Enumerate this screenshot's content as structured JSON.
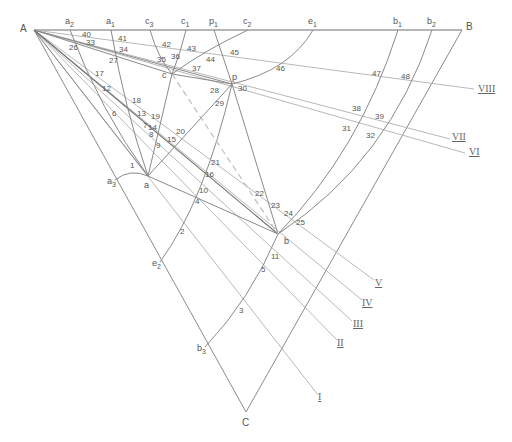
{
  "diagram": {
    "vertices": {
      "A": {
        "label": "A",
        "x": 34,
        "y": 30
      },
      "B": {
        "label": "B",
        "x": 462,
        "y": 30
      },
      "C": {
        "label": "C",
        "x": 246,
        "y": 412
      }
    },
    "top_points": [
      {
        "label": "a",
        "sub": "2",
        "x": 70
      },
      {
        "label": "a",
        "sub": "1",
        "x": 111
      },
      {
        "label": "c",
        "sub": "3",
        "x": 150
      },
      {
        "label": "c",
        "sub": "1",
        "x": 186
      },
      {
        "label": "p",
        "sub": "1",
        "x": 214
      },
      {
        "label": "c",
        "sub": "2",
        "x": 248
      },
      {
        "label": "e",
        "sub": "1",
        "x": 313
      },
      {
        "label": "b",
        "sub": "1",
        "x": 398
      },
      {
        "label": "b",
        "sub": "2",
        "x": 432
      }
    ],
    "inner_points": [
      {
        "label": "c",
        "x": 172,
        "y": 74
      },
      {
        "label": "p",
        "x": 232,
        "y": 84
      },
      {
        "label": "a",
        "x": 148,
        "y": 176
      },
      {
        "label": "b",
        "x": 278,
        "y": 234
      }
    ],
    "left_side_points": [
      {
        "label": "a",
        "sub": "3",
        "x": 115,
        "y": 180
      },
      {
        "label": "e",
        "sub": "2",
        "x": 160,
        "y": 262
      },
      {
        "label": "b",
        "sub": "3",
        "x": 205,
        "y": 347
      }
    ],
    "rays": [
      {
        "label": "I",
        "x": 318,
        "y": 400
      },
      {
        "label": "II",
        "x": 337,
        "y": 346
      },
      {
        "label": "III",
        "x": 353,
        "y": 327
      },
      {
        "label": "IV",
        "x": 362,
        "y": 306
      },
      {
        "label": "V",
        "x": 375,
        "y": 286
      },
      {
        "label": "VI",
        "x": 469,
        "y": 155
      },
      {
        "label": "VII",
        "x": 452,
        "y": 140
      },
      {
        "label": "VIII",
        "x": 478,
        "y": 92
      }
    ],
    "numbered_points": [
      {
        "n": "1",
        "x": 130,
        "y": 168
      },
      {
        "n": "2",
        "x": 180,
        "y": 234
      },
      {
        "n": "3",
        "x": 239,
        "y": 313
      },
      {
        "n": "4",
        "x": 195,
        "y": 204
      },
      {
        "n": "5",
        "x": 261,
        "y": 272
      },
      {
        "n": "6",
        "x": 112,
        "y": 116
      },
      {
        "n": "7",
        "x": 143,
        "y": 128
      },
      {
        "n": "8",
        "x": 149,
        "y": 137
      },
      {
        "n": "9",
        "x": 156,
        "y": 148
      },
      {
        "n": "10",
        "x": 199,
        "y": 193
      },
      {
        "n": "11",
        "x": 271,
        "y": 259
      },
      {
        "n": "12",
        "x": 102,
        "y": 91
      },
      {
        "n": "13",
        "x": 137,
        "y": 116
      },
      {
        "n": "14",
        "x": 148,
        "y": 130
      },
      {
        "n": "15",
        "x": 167,
        "y": 142
      },
      {
        "n": "16",
        "x": 205,
        "y": 177
      },
      {
        "n": "17",
        "x": 95,
        "y": 76
      },
      {
        "n": "18",
        "x": 132,
        "y": 103
      },
      {
        "n": "19",
        "x": 151,
        "y": 119
      },
      {
        "n": "20",
        "x": 176,
        "y": 134
      },
      {
        "n": "21",
        "x": 211,
        "y": 165
      },
      {
        "n": "22",
        "x": 255,
        "y": 196
      },
      {
        "n": "23",
        "x": 271,
        "y": 208
      },
      {
        "n": "24",
        "x": 284,
        "y": 216
      },
      {
        "n": "25",
        "x": 296,
        "y": 225
      },
      {
        "n": "26",
        "x": 69,
        "y": 50
      },
      {
        "n": "27",
        "x": 109,
        "y": 63
      },
      {
        "n": "28",
        "x": 210,
        "y": 93
      },
      {
        "n": "29",
        "x": 215,
        "y": 106
      },
      {
        "n": "30",
        "x": 238,
        "y": 91
      },
      {
        "n": "31",
        "x": 342,
        "y": 131
      },
      {
        "n": "32",
        "x": 366,
        "y": 138
      },
      {
        "n": "33",
        "x": 86,
        "y": 45
      },
      {
        "n": "34",
        "x": 119,
        "y": 52
      },
      {
        "n": "35",
        "x": 157,
        "y": 62
      },
      {
        "n": "36",
        "x": 171,
        "y": 59
      },
      {
        "n": "37",
        "x": 192,
        "y": 71
      },
      {
        "n": "38",
        "x": 352,
        "y": 111
      },
      {
        "n": "39",
        "x": 375,
        "y": 119
      },
      {
        "n": "40",
        "x": 82,
        "y": 37
      },
      {
        "n": "41",
        "x": 118,
        "y": 41
      },
      {
        "n": "42",
        "x": 162,
        "y": 47
      },
      {
        "n": "43",
        "x": 187,
        "y": 51
      },
      {
        "n": "44",
        "x": 206,
        "y": 62
      },
      {
        "n": "45",
        "x": 230,
        "y": 55
      },
      {
        "n": "46",
        "x": 276,
        "y": 71
      },
      {
        "n": "47",
        "x": 372,
        "y": 76
      },
      {
        "n": "48",
        "x": 401,
        "y": 79
      }
    ]
  }
}
